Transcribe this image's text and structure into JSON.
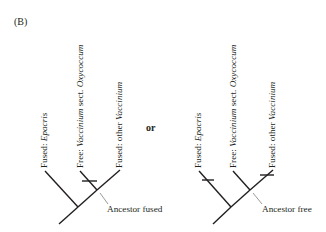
{
  "panel_label": "(B)",
  "connector": "or",
  "trees": [
    {
      "id": "ancestor-fused",
      "ancestor_label": "Ancestor fused",
      "tips": [
        {
          "state": "Fused: ",
          "taxon": "Epacris"
        },
        {
          "state": "Free: ",
          "taxon": "Vaccinium",
          "suffix": " sect. ",
          "taxon2": "Oxycoccum"
        },
        {
          "state": "Fused: other ",
          "taxon": "Vaccinium"
        }
      ],
      "transitions": [
        "Free: Vaccinium sect. Oxycoccum branch"
      ]
    },
    {
      "id": "ancestor-free",
      "ancestor_label": "Ancestor free",
      "tips": [
        {
          "state": "Fused: ",
          "taxon": "Epacris"
        },
        {
          "state": "Free: ",
          "taxon": "Vaccinium",
          "suffix": " sect. ",
          "taxon2": "Oxycoccum"
        },
        {
          "state": "Fused: other ",
          "taxon": "Vaccinium"
        }
      ],
      "transitions": [
        "Fused: Epacris branch",
        "Fused: other Vaccinium branch"
      ]
    }
  ],
  "colors": {
    "line": "#231f20",
    "pointer": "#808080"
  }
}
